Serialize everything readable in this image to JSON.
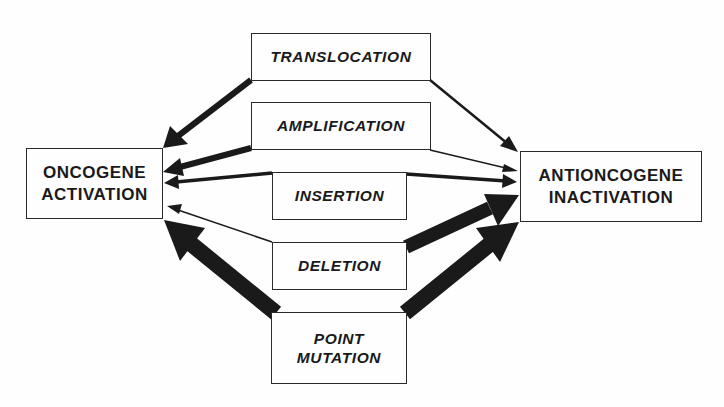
{
  "diagram": {
    "targets": {
      "oncogene": {
        "line1": "ONCOGENE",
        "line2": "ACTIVATION"
      },
      "antioncogene": {
        "line1": "ANTIONCOGENE",
        "line2": "INACTIVATION"
      }
    },
    "mechanisms": {
      "translocation": {
        "label": "TRANSLOCATION"
      },
      "amplification": {
        "label": "AMPLIFICATION"
      },
      "insertion": {
        "label": "INSERTION"
      },
      "deletion": {
        "label": "DELETION"
      },
      "point_mutation": {
        "line1": "POINT",
        "line2": "MUTATION"
      }
    },
    "edges": [
      {
        "from": "TRANSLOCATION",
        "to": "ONCOGENE ACTIVATION",
        "weight": "strong"
      },
      {
        "from": "TRANSLOCATION",
        "to": "ANTIONCOGENE INACTIVATION",
        "weight": "weak"
      },
      {
        "from": "AMPLIFICATION",
        "to": "ONCOGENE ACTIVATION",
        "weight": "strong"
      },
      {
        "from": "AMPLIFICATION",
        "to": "ANTIONCOGENE INACTIVATION",
        "weight": "very weak"
      },
      {
        "from": "INSERTION",
        "to": "ONCOGENE ACTIVATION",
        "weight": "moderate"
      },
      {
        "from": "INSERTION",
        "to": "ANTIONCOGENE INACTIVATION",
        "weight": "moderate"
      },
      {
        "from": "DELETION",
        "to": "ONCOGENE ACTIVATION",
        "weight": "very weak"
      },
      {
        "from": "DELETION",
        "to": "ANTIONCOGENE INACTIVATION",
        "weight": "very strong"
      },
      {
        "from": "POINT MUTATION",
        "to": "ONCOGENE ACTIVATION",
        "weight": "very strong"
      },
      {
        "from": "POINT MUTATION",
        "to": "ANTIONCOGENE INACTIVATION",
        "weight": "very strong"
      }
    ],
    "colors": {
      "ink": "#1a1a1a",
      "background": "#fefefe",
      "border": "#2a2a2a"
    }
  }
}
